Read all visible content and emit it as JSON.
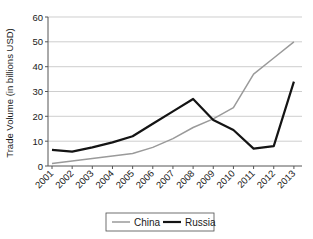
{
  "chart_data": {
    "type": "line",
    "title": "",
    "xlabel": "",
    "ylabel": "Trade Volume (in billions USD)",
    "categories": [
      "2001",
      "2002",
      "2003",
      "2004",
      "2005",
      "2006",
      "2007",
      "2008",
      "2009",
      "2010",
      "2011",
      "2012",
      "2013"
    ],
    "ylim": [
      0,
      60
    ],
    "yticks": [
      0,
      10,
      20,
      30,
      40,
      50,
      60
    ],
    "ytick_labels": [
      "0",
      "10",
      "20",
      "30",
      "40",
      "50",
      "60"
    ],
    "grid": "horizontal",
    "legend_position": "bottom-center",
    "series": [
      {
        "name": "China",
        "color": "#9a9a9a",
        "width": 1.5,
        "values": [
          1,
          2,
          3,
          4,
          5,
          7.5,
          11,
          15.5,
          19,
          23.5,
          37,
          43.5,
          50
        ]
      },
      {
        "name": "Russia",
        "color": "#141414",
        "width": 2.2,
        "values": [
          6.5,
          5.8,
          7.5,
          9.5,
          12,
          17,
          22,
          27,
          18.5,
          14.5,
          7,
          8,
          34
        ]
      }
    ]
  },
  "legend": {
    "items": [
      {
        "label": "China"
      },
      {
        "label": "Russia"
      }
    ]
  },
  "axes": {
    "y_title": "Trade Volume (in billions USD)"
  }
}
